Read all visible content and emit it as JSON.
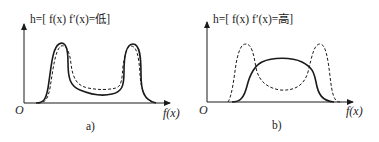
{
  "panels": [
    {
      "id": "a",
      "title": "h=[ f(x) f′(x)=低]",
      "origin_label": "O",
      "x_axis_label": "f(x)",
      "caption": "a)"
    },
    {
      "id": "b",
      "title": "h=[ f(x) f′(x)=高]",
      "origin_label": "O",
      "x_axis_label": "f(x)",
      "caption": "b)"
    }
  ],
  "colors": {
    "line": "#1a1a1a",
    "text": "#222222",
    "background": "#ffffff"
  },
  "line_styles": {
    "solid": "solid curve",
    "dashed": "dashed curve"
  }
}
